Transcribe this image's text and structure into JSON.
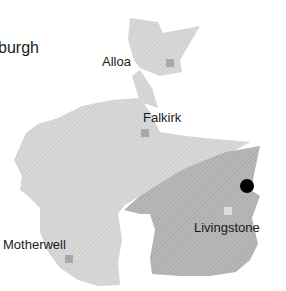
{
  "map": {
    "colors": {
      "background": "#ffffff",
      "region_light": "#d6d6d6",
      "region_dark": "#b4b4b4",
      "town_marker_light": "#a8a8a8",
      "town_marker_on_dark": "#dedede",
      "location_dot": "#000000",
      "label_text": "#1a1a1a"
    },
    "top_partial_text": "Edinburgh",
    "labels": {
      "edinburgh_partial": "burgh",
      "alloa": "Alloa",
      "falkirk": "Falkirk",
      "livingstone": "Livingstone",
      "motherwell": "Motherwell"
    },
    "towns": [
      {
        "name": "Alloa",
        "marker_x": 170,
        "marker_y": 63
      },
      {
        "name": "Falkirk",
        "marker_x": 145,
        "marker_y": 133
      },
      {
        "name": "Livingstone",
        "marker_x": 228,
        "marker_y": 211
      },
      {
        "name": "Motherwell",
        "marker_x": 69,
        "marker_y": 259
      }
    ],
    "location_marker": {
      "x": 247,
      "y": 186,
      "radius": 7
    }
  }
}
